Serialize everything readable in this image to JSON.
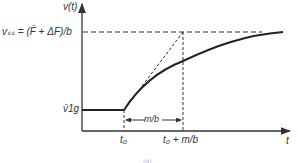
{
  "diagram": {
    "y_axis_label": "v(t)",
    "x_axis_label": "t",
    "vss_label": "vₛₛ = (F̄ + ΔF)/b",
    "v1g_label": "v̄1g",
    "t0_label": "t₀",
    "t0_plus_label": "t₀ + m/b",
    "interval_label": "m/b",
    "caption": "(a)"
  }
}
